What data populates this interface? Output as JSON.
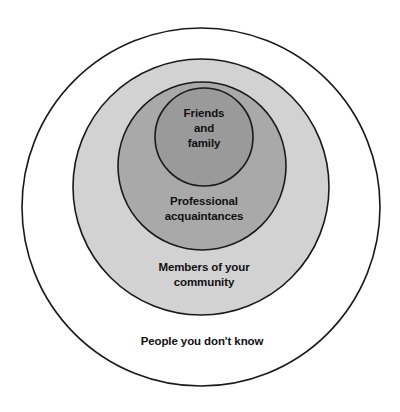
{
  "diagram": {
    "background_color": "#ffffff",
    "stroke_color": "#1a1a1a",
    "text_color": "#111111",
    "rings": [
      {
        "id": "strangers",
        "level": 4,
        "label": "People you don't know",
        "fill": "#ffffff",
        "center_x": 201,
        "center_y": 207,
        "radius": 179
      },
      {
        "id": "community",
        "level": 3,
        "label": "Members of your\ncommunity",
        "fill": "#d2d2d2",
        "center_x": 201,
        "center_y": 187,
        "radius": 128
      },
      {
        "id": "professional",
        "level": 2,
        "label": "Professional\nacquaintances",
        "fill": "#a9a9a9",
        "center_x": 202,
        "center_y": 166,
        "radius": 84
      },
      {
        "id": "friends-family",
        "level": 1,
        "label": "Friends\nand\nfamily",
        "fill": "#9a9a9a",
        "center_x": 204,
        "center_y": 137,
        "radius": 49
      }
    ]
  }
}
